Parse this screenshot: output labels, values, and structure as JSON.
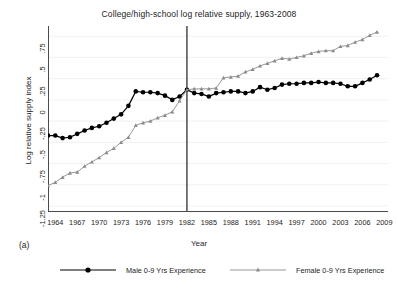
{
  "figure": {
    "panel_letter": "(a)",
    "background": "#ffffff"
  },
  "chart_data": {
    "type": "line",
    "title": "College/high-school log relative supply, 1963-2008",
    "xlabel": "Year",
    "ylabel": "Log relative supply index",
    "xlim": [
      1963,
      2009.5
    ],
    "ylim": [
      -1.32,
      0.87
    ],
    "grid": "horizontal-faint",
    "legend_position": "below-outside",
    "annotations": [
      {
        "type": "vline",
        "x": 1982,
        "color": "#555555",
        "label": "1982"
      }
    ],
    "xticks": [
      1964,
      1967,
      1970,
      1973,
      1976,
      1979,
      1982,
      1985,
      1988,
      1991,
      1994,
      1997,
      2000,
      2003,
      2006,
      2009
    ],
    "xticklabels": [
      "1964",
      "1967",
      "1970",
      "1973",
      "1976",
      "1979",
      "1982",
      "1985",
      "1988",
      "1991",
      "1994",
      "1997",
      "2000",
      "2003",
      "2006",
      "2009"
    ],
    "yticks": [
      0.75,
      0.5,
      0.25,
      0,
      -0.25,
      -0.5,
      -0.75,
      -1,
      -1.25
    ],
    "yticklabels": [
      ".75",
      ".5",
      ".25",
      "0",
      "-.25",
      "-.5",
      "-.75",
      "-1",
      "-1.25"
    ],
    "x": [
      1963,
      1964,
      1965,
      1966,
      1967,
      1968,
      1969,
      1970,
      1971,
      1972,
      1973,
      1974,
      1975,
      1976,
      1977,
      1978,
      1979,
      1980,
      1981,
      1982,
      1983,
      1984,
      1985,
      1986,
      1987,
      1988,
      1989,
      1990,
      1991,
      1992,
      1993,
      1994,
      1995,
      1996,
      1997,
      1998,
      1999,
      2000,
      2001,
      2002,
      2003,
      2004,
      2005,
      2006,
      2007,
      2008
    ],
    "series": [
      {
        "name": "Male 0-9 Yrs Experience",
        "color": "#000000",
        "marker": "circle",
        "values": [
          -0.42,
          -0.42,
          -0.45,
          -0.44,
          -0.4,
          -0.36,
          -0.33,
          -0.31,
          -0.27,
          -0.22,
          -0.17,
          -0.07,
          0.1,
          0.09,
          0.09,
          0.08,
          0.05,
          0.0,
          0.04,
          0.12,
          0.08,
          0.07,
          0.04,
          0.08,
          0.09,
          0.1,
          0.1,
          0.08,
          0.1,
          0.15,
          0.12,
          0.14,
          0.18,
          0.19,
          0.19,
          0.2,
          0.2,
          0.21,
          0.2,
          0.2,
          0.19,
          0.16,
          0.16,
          0.2,
          0.24,
          0.29
        ]
      },
      {
        "name": "Female 0-9 Yrs Experience",
        "color": "#8c8c8c",
        "marker": "triangle",
        "values": [
          -1.01,
          -0.97,
          -0.91,
          -0.86,
          -0.85,
          -0.78,
          -0.73,
          -0.68,
          -0.62,
          -0.57,
          -0.5,
          -0.44,
          -0.3,
          -0.27,
          -0.25,
          -0.21,
          -0.18,
          -0.14,
          -0.01,
          0.12,
          0.13,
          0.13,
          0.13,
          0.14,
          0.26,
          0.27,
          0.28,
          0.33,
          0.36,
          0.4,
          0.43,
          0.46,
          0.49,
          0.48,
          0.5,
          0.52,
          0.55,
          0.57,
          0.58,
          0.58,
          0.63,
          0.64,
          0.68,
          0.71,
          0.76,
          0.8
        ]
      }
    ]
  }
}
